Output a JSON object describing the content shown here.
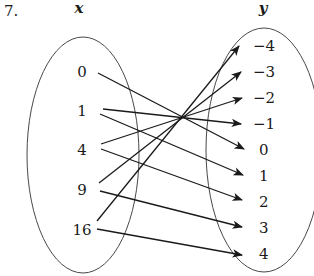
{
  "problem": {
    "number": "7."
  },
  "domain_set": {
    "label": "x",
    "values": [
      "0",
      "1",
      "4",
      "9",
      "16"
    ]
  },
  "range_set": {
    "label": "y",
    "values": [
      "−4",
      "−3",
      "−2",
      "−1",
      "0",
      "1",
      "2",
      "3",
      "4"
    ]
  },
  "mappings": [
    {
      "from": "0",
      "to": "0"
    },
    {
      "from": "1",
      "to": "−1"
    },
    {
      "from": "1",
      "to": "1"
    },
    {
      "from": "4",
      "to": "−2"
    },
    {
      "from": "4",
      "to": "2"
    },
    {
      "from": "9",
      "to": "−3"
    },
    {
      "from": "9",
      "to": "3"
    },
    {
      "from": "16",
      "to": "−4"
    },
    {
      "from": "16",
      "to": "4"
    }
  ],
  "colors": {
    "stroke": "#1a1a1a",
    "background": "#ffffff"
  }
}
